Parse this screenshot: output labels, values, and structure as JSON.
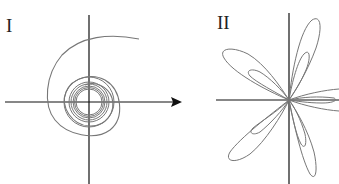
{
  "figure_I": {
    "label": "I",
    "curve": "spiral",
    "description": "Spiral curve winding inward toward a limit circle around the origin"
  },
  "figure_II": {
    "label": "II",
    "curve": "rose",
    "description": "Rose curve with inner and outer loops forming petals through the origin"
  },
  "colors": {
    "axis": "#111111",
    "curve": "#777777"
  }
}
